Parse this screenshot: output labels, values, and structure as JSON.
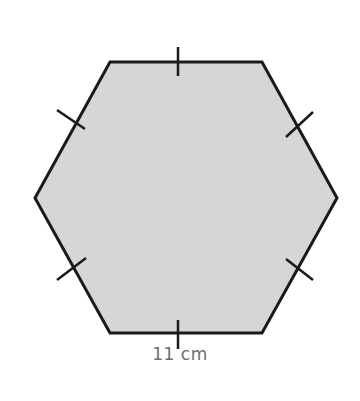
{
  "figure": {
    "shape": "regular-hexagon",
    "fill_color": "#d6d6d6",
    "stroke_color": "#1a1a1a",
    "vertices": [
      [
        110,
        62
      ],
      [
        262,
        62
      ],
      [
        337,
        198
      ],
      [
        262,
        333
      ],
      [
        110,
        333
      ],
      [
        35,
        198
      ]
    ],
    "equal_side_ticks": 6,
    "side_label": "11 cm",
    "label_color": "#6e6e6e"
  }
}
